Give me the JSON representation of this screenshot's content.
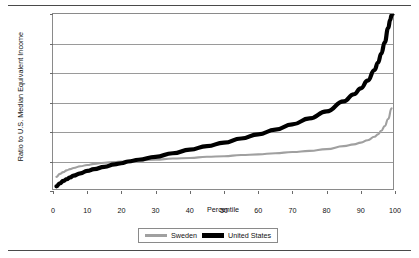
{
  "figure": {
    "has_top_rule": true,
    "has_bottom_rule": true,
    "background": "#ffffff"
  },
  "chart_data": {
    "type": "line",
    "title": "",
    "xlabel": "Percentile",
    "ylabel": "Ratio to U.S. Median Equivalent Income",
    "xlim": [
      0,
      100
    ],
    "ylim": [
      0,
      300
    ],
    "xticks": [
      0,
      10,
      20,
      30,
      40,
      50,
      60,
      70,
      80,
      90,
      100
    ],
    "yticks": [
      0,
      50,
      100,
      150,
      200,
      250,
      300
    ],
    "grid": "horizontal",
    "legend_position": "bottom-center",
    "series": [
      {
        "name": "Sweden",
        "color": "#a0a0a0",
        "width": 2.1,
        "x": [
          1,
          2,
          3,
          4,
          5,
          6,
          8,
          10,
          12,
          15,
          18,
          20,
          22,
          25,
          30,
          35,
          40,
          45,
          50,
          55,
          60,
          65,
          70,
          75,
          80,
          85,
          88,
          90,
          92,
          94,
          95,
          96,
          97,
          98,
          99
        ],
        "y": [
          24,
          29,
          32,
          35,
          37,
          39,
          42,
          44,
          46,
          48,
          49,
          50,
          51,
          52,
          53,
          55,
          56,
          58,
          59,
          61,
          62,
          64,
          66,
          68,
          71,
          76,
          79,
          82,
          86,
          92,
          96,
          102,
          110,
          122,
          140
        ]
      },
      {
        "name": "United States",
        "color": "#000000",
        "width": 4.2,
        "x": [
          1,
          2,
          3,
          4,
          5,
          6,
          8,
          10,
          12,
          15,
          18,
          20,
          22,
          25,
          30,
          35,
          40,
          45,
          50,
          55,
          60,
          65,
          70,
          75,
          80,
          85,
          88,
          90,
          92,
          94,
          95,
          96,
          97,
          98,
          98.6,
          99,
          99.3
        ],
        "y": [
          8,
          13,
          17,
          20,
          23,
          26,
          30,
          34,
          37,
          41,
          45,
          47,
          50,
          53,
          58,
          64,
          70,
          76,
          82,
          89,
          96,
          104,
          113,
          123,
          135,
          152,
          164,
          174,
          187,
          205,
          217,
          233,
          252,
          276,
          290,
          298,
          300
        ]
      }
    ],
    "legend": [
      {
        "label": "Sweden",
        "swatch": "sweden"
      },
      {
        "label": "United States",
        "swatch": "us"
      }
    ]
  }
}
